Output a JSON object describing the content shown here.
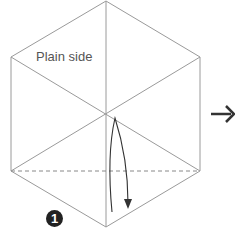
{
  "diagram": {
    "side_label": "Plain side",
    "step_number": "1",
    "colors": {
      "line": "#9a9a9a",
      "arrow": "#333333",
      "step_bg": "#222222"
    },
    "elements": [
      "hexagon-outline",
      "three diagonal crease lines through center",
      "horizontal dashed fold line",
      "curved fold arrow pointing down",
      "next-step arrow pointing right"
    ]
  }
}
